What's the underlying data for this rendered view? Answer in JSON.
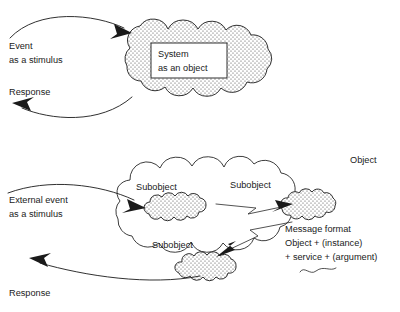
{
  "figure": {
    "background_color": "#ffffff",
    "ink_color": "#1a1a1a"
  },
  "top_panel": {
    "name": "system-as-object-panel",
    "input_label_line1": "Event",
    "input_label_line2": "as a stimulus",
    "output_label": "Response",
    "cloud_label_line1": "System",
    "cloud_label_line2": "as an object"
  },
  "bottom_panel": {
    "name": "object-with-subobjects-panel",
    "input_label_line1": "External event",
    "input_label_line2": "as a stimulus",
    "output_label": "Response",
    "object_label": "Object",
    "subobject_labels": [
      "Subobject",
      "Subobject",
      "Subobject"
    ],
    "message_format": {
      "line1": "Message format",
      "line2": "Object + (instance)",
      "line3": "+ service + (argument)"
    }
  }
}
